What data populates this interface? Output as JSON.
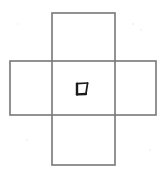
{
  "figure": {
    "title": "Cube net with character in center face",
    "background_color": "#ffffff",
    "line_color": "#777777",
    "glyph_color": "#1b1b1b",
    "line_width": 1.6,
    "shapes": [
      {
        "name": "vertical-rectangle",
        "x": 52,
        "y": 13,
        "width": 63,
        "height": 152
      },
      {
        "name": "horizontal-rectangle",
        "x": 10,
        "y": 61,
        "width": 146,
        "height": 54
      }
    ],
    "cells": [
      {
        "name": "top-face",
        "position": "top"
      },
      {
        "name": "left-face",
        "position": "left"
      },
      {
        "name": "center-face",
        "position": "center",
        "label": "口"
      },
      {
        "name": "right-face",
        "position": "right"
      },
      {
        "name": "bottom-face",
        "position": "bottom"
      }
    ],
    "center_glyph": {
      "name": "kou-character",
      "character": "口",
      "meaning": "mouth / box",
      "x": 76,
      "y": 83,
      "width": 12,
      "height": 12,
      "style": "hand-drawn quadrilateral, slanted top-right corner"
    }
  }
}
